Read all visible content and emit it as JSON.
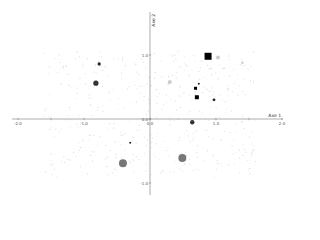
{
  "chart_data": {
    "type": "scatter",
    "title": "",
    "xlabel": "Axe 1",
    "ylabel": "Axe 2",
    "xlim": [
      -2.2,
      2.1
    ],
    "ylim": [
      -1.4,
      1.8
    ],
    "grid": false,
    "legend": null,
    "x_ticks": [
      -2.0,
      -1.5,
      -1.0,
      0.0,
      1.0,
      1.5,
      2.0
    ],
    "x_tick_labels": [
      "-2.0",
      "",
      "-1.0",
      "0.0",
      "1.0",
      "",
      "2.0"
    ],
    "y_ticks": [
      1.0,
      0.0,
      -1.0
    ],
    "y_tick_labels": [
      "1.0",
      "0.0",
      "-1.0"
    ],
    "note": "Coordinates of the highlighted markers are approximate estimates read from a low-resolution image (roughly ±0.05 axis units). The faint grey background cloud could not be transcribed point-by-point; it is rendered procedurally for visual texture and does not represent actual data.",
    "series": [
      {
        "name": "large-squares",
        "marker": "square",
        "color": "#000000",
        "points": [
          {
            "x": 0.88,
            "y": 0.98,
            "size": 7
          }
        ]
      },
      {
        "name": "medium-squares",
        "marker": "square",
        "color": "#000000",
        "points": [
          {
            "x": 0.71,
            "y": 0.34,
            "size": 4
          },
          {
            "x": 0.69,
            "y": 0.48,
            "size": 3
          }
        ]
      },
      {
        "name": "small-dark-dots",
        "marker": "circle",
        "color": "#222222",
        "points": [
          {
            "x": -0.77,
            "y": 0.86,
            "size": 1.6
          },
          {
            "x": 0.97,
            "y": 0.3,
            "size": 1.4
          },
          {
            "x": 0.74,
            "y": 0.55,
            "size": 1.0
          },
          {
            "x": -0.3,
            "y": -0.37,
            "size": 1.0
          }
        ]
      },
      {
        "name": "medium-dark-dots",
        "marker": "circle",
        "color": "#333333",
        "points": [
          {
            "x": -0.82,
            "y": 0.56,
            "size": 2.6
          },
          {
            "x": 0.64,
            "y": -0.05,
            "size": 2.2
          }
        ]
      },
      {
        "name": "large-grey-dots",
        "marker": "circle",
        "color": "#777777",
        "points": [
          {
            "x": -0.41,
            "y": -0.69,
            "size": 4
          },
          {
            "x": 0.49,
            "y": -0.61,
            "size": 4
          }
        ]
      },
      {
        "name": "light-grey-markers",
        "marker": "circle",
        "color": "#cccccc",
        "points": [
          {
            "x": 1.03,
            "y": 0.96,
            "size": 2
          },
          {
            "x": 0.3,
            "y": 0.58,
            "size": 2
          },
          {
            "x": 1.4,
            "y": 0.88,
            "size": 1.2
          }
        ]
      },
      {
        "name": "background-cloud",
        "marker": "circle",
        "color": "#d8d8d8",
        "rendering": "procedural",
        "description": "Dense cloud of faint grey points spread over roughly x in [-1.5, 1.6], y in [-1.0, 1.1]. Individual positions are not recoverable at this resolution, so they are drawn procedurally to suggest the texture only."
      }
    ]
  },
  "axes": {
    "x_title": "Axe 1",
    "y_title": "Axe 2"
  }
}
